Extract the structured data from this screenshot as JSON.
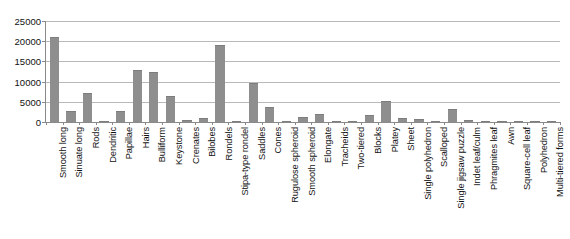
{
  "chart_data": {
    "type": "bar",
    "title": "",
    "xlabel": "",
    "ylabel": "",
    "ylim": [
      0,
      25000
    ],
    "y_ticks": [
      0,
      5000,
      10000,
      15000,
      20000,
      25000
    ],
    "y_tick_labels": [
      "0",
      "5000",
      "10000",
      "15000",
      "20000",
      "25000"
    ],
    "grid": true,
    "legend": "none",
    "bar_color": "#8e8e8e",
    "gridline_color": "#b9b9b9",
    "axis_color": "#8a8a8a",
    "categories": [
      "Smooth long",
      "Sinuate long",
      "Rods",
      "Dendritic",
      "Papillae",
      "Hairs",
      "Bulliform",
      "Keystone",
      "Crenates",
      "Bilobes",
      "Rondels",
      "Stipa-type rondel",
      "Saddles",
      "Cones",
      "Rugulose spheroid",
      "Smooth spheroid",
      "Elongate",
      "Tracheids",
      "Two-tiered",
      "Blocks",
      "Platey",
      "Sheet",
      "Single polyhedron",
      "Scalloped",
      "Single jigsaw puzzle",
      "Indet leaf/culm",
      "Phragmites leaf",
      "Awn",
      "Square-cell leaf",
      "Polyhedron",
      "Multi-tiered forms"
    ],
    "values": [
      21000,
      2800,
      7300,
      250,
      2700,
      12800,
      12350,
      6400,
      450,
      900,
      19000,
      100,
      9700,
      3600,
      300,
      1300,
      1900,
      120,
      180,
      1700,
      5200,
      1050,
      850,
      180,
      3150,
      500,
      120,
      100,
      120,
      100,
      120
    ]
  }
}
